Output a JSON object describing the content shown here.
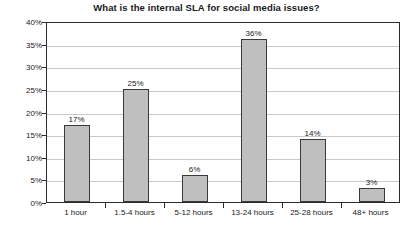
{
  "chart_data": {
    "type": "bar",
    "title": "What is the internal SLA for social media issues?",
    "xlabel": "",
    "ylabel": "",
    "categories": [
      "1 hour",
      "1.5-4 hours",
      "5-12 hours",
      "13-24 hours",
      "25-28 hours",
      "48+ hours"
    ],
    "values": [
      17,
      25,
      6,
      36,
      14,
      3
    ],
    "data_labels": [
      "17%",
      "25%",
      "6%",
      "36%",
      "14%",
      "3%"
    ],
    "ylim": [
      0,
      40
    ],
    "ytick_values": [
      0,
      5,
      10,
      15,
      20,
      25,
      30,
      35,
      40
    ],
    "ytick_labels": [
      "0%",
      "5%",
      "10%",
      "15%",
      "20%",
      "25%",
      "30%",
      "35%",
      "40%"
    ],
    "grid": true,
    "legend": false,
    "legend_position": "none",
    "colors": {
      "bar_fill": "#bfbfbf",
      "bar_border": "#3a3a3a",
      "gridline": "#c9c9c9",
      "axis": "#2b2b2b",
      "text": "#1a1a1a",
      "background": "#ffffff"
    }
  }
}
